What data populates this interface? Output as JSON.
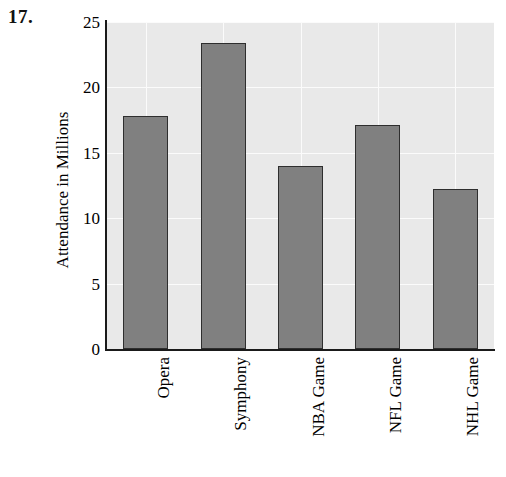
{
  "problem": {
    "number": "17."
  },
  "chart_data": {
    "type": "bar",
    "title": "",
    "xlabel": "",
    "ylabel": "Attendance in Millions",
    "categories": [
      "Opera",
      "Symphony",
      "NBA Game",
      "NFL Game",
      "NHL Game"
    ],
    "values": [
      17.8,
      23.4,
      14.0,
      17.1,
      12.2
    ],
    "ylim": [
      0,
      25
    ],
    "ytick_labels": [
      "0",
      "5",
      "10",
      "15",
      "20",
      "25"
    ],
    "ytick_values": [
      0,
      5,
      10,
      15,
      20,
      25
    ],
    "grid": true,
    "legend": "none",
    "colors": {
      "bar_fill": "#808080",
      "bar_border": "#2e2e2e",
      "plot_background": "#e9e9e9",
      "gridline": "#fbfbfb",
      "axis": "#1a1a1a",
      "text": "#000000"
    }
  }
}
